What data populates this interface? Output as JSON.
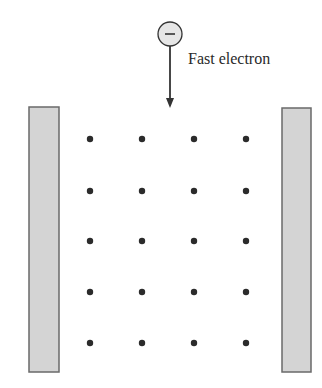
{
  "diagram": {
    "label": "Fast electron",
    "electron_symbol": "−",
    "colors": {
      "plate_fill": "#d4d4d4",
      "plate_stroke": "#6a6a6a",
      "dot": "#2b2b2b",
      "electron_fill": "#e6e6e6",
      "line": "#333333"
    },
    "plates": [
      {
        "name": "left-plate",
        "x": 29,
        "y": 107,
        "w": 30,
        "h": 265
      },
      {
        "name": "right-plate",
        "x": 282,
        "y": 108,
        "w": 29,
        "h": 264
      }
    ],
    "grid": {
      "xs": [
        90,
        142,
        194,
        246
      ],
      "ys": [
        139,
        191,
        241,
        292,
        343
      ],
      "r": 3.2
    },
    "electron": {
      "cx": 170,
      "cy": 34,
      "r": 12
    },
    "arrow": {
      "x": 170,
      "y1": 46,
      "y2": 108
    }
  }
}
